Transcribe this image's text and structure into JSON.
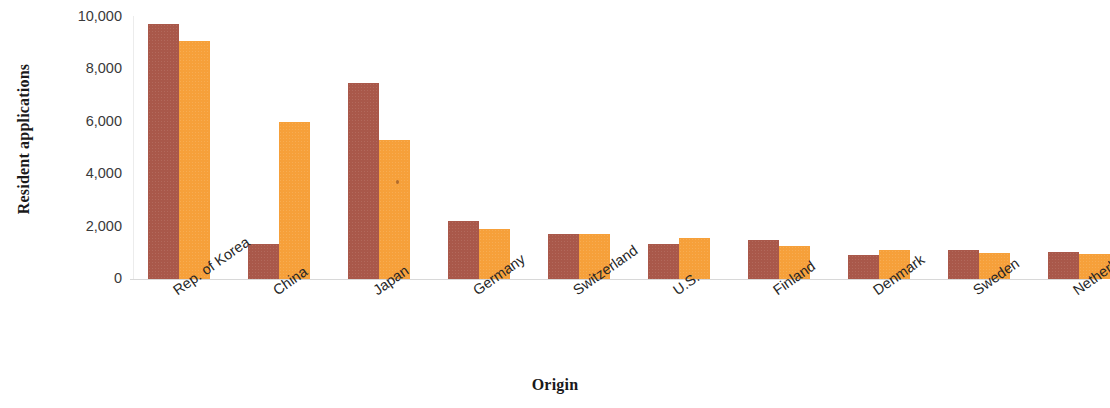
{
  "chart_data": {
    "type": "bar",
    "title": "",
    "subtitle": "",
    "xlabel": "Origin",
    "ylabel": "Resident applications",
    "categories": [
      "Rep. of Korea",
      "China",
      "Japan",
      "Germany",
      "Switzerland",
      "U.S.",
      "Finland",
      "Denmark",
      "Sweden",
      "Netherlands"
    ],
    "series": [
      {
        "name": "series-1",
        "color": "#a9584a",
        "values": [
          9750,
          1350,
          7500,
          2200,
          1700,
          1350,
          1500,
          900,
          1100,
          1050
        ]
      },
      {
        "name": "series-2",
        "color": "#f6a03a",
        "values": [
          9100,
          6000,
          5300,
          1900,
          1700,
          1550,
          1250,
          1100,
          1000,
          950
        ]
      }
    ],
    "yticks": [
      0,
      2000,
      4000,
      6000,
      8000,
      10000
    ],
    "ytick_labels": [
      "0",
      "2,000",
      "4,000",
      "6,000",
      "8,000",
      "10,000"
    ],
    "ylim": [
      0,
      10000
    ],
    "grid": false,
    "legend": "none",
    "xtick_rotation": -35
  },
  "axes": {
    "y_title": "Resident applications",
    "x_title": "Origin"
  },
  "colors": {
    "series_1": "#a9584a",
    "series_2": "#f6a03a",
    "axis_line": "#d8d8d8",
    "tick_text": "#3a3a3a",
    "title_text": "#1a1a1a",
    "background": "#ffffff"
  }
}
